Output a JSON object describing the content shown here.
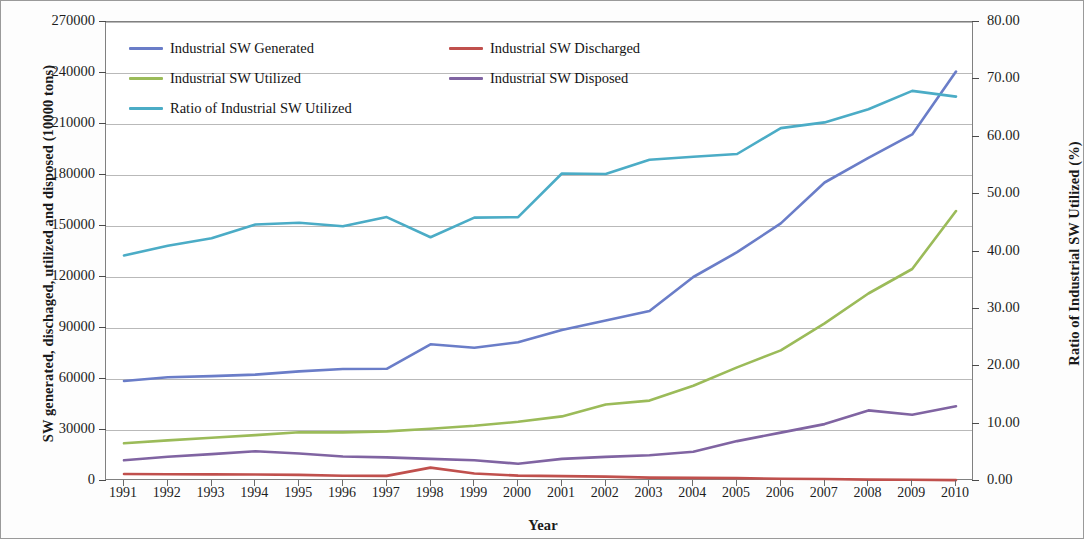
{
  "chart_data": {
    "type": "line",
    "title": "",
    "xlabel": "Year",
    "ylabel": "SW generated, dischaged, utilized and disposed (10000 tons)",
    "y2label": "Ratio of Industrial SW Utilized (%)",
    "categories": [
      "1991",
      "1992",
      "1993",
      "1994",
      "1995",
      "1996",
      "1997",
      "1998",
      "1999",
      "2000",
      "2001",
      "2002",
      "2003",
      "2004",
      "2005",
      "2006",
      "2007",
      "2008",
      "2009",
      "2010"
    ],
    "ylim": [
      0,
      270000
    ],
    "yticks": [
      "0",
      "30000",
      "60000",
      "90000",
      "120000",
      "150000",
      "180000",
      "210000",
      "240000",
      "270000"
    ],
    "ytick_values": [
      0,
      30000,
      60000,
      90000,
      120000,
      150000,
      180000,
      210000,
      240000,
      270000
    ],
    "y2lim": [
      0,
      80
    ],
    "y2ticks": [
      "0.00",
      "10.00",
      "20.00",
      "30.00",
      "40.00",
      "50.00",
      "60.00",
      "70.00",
      "80.00"
    ],
    "y2tick_values": [
      0,
      10,
      20,
      30,
      40,
      50,
      60,
      70,
      80
    ],
    "grid": true,
    "legend_position": "top-left-inside",
    "series": [
      {
        "name": "Industrial SW Generated",
        "color": "#6A7DC8",
        "axis": "left",
        "values": [
          58800,
          61000,
          61700,
          62600,
          64500,
          65900,
          66000,
          80400,
          78400,
          81600,
          88800,
          94500,
          100000,
          120000,
          134600,
          151500,
          175600,
          190100,
          203900,
          240900
        ]
      },
      {
        "name": "Industrial SW Discharged",
        "color": "#C0504D",
        "axis": "left",
        "values": [
          4100,
          4000,
          3900,
          3800,
          3600,
          3100,
          3000,
          7900,
          4400,
          3200,
          2900,
          2600,
          2000,
          1800,
          1700,
          1300,
          1200,
          800,
          700,
          500
        ]
      },
      {
        "name": "Industrial SW  Utilized",
        "color": "#9BBB59",
        "axis": "left",
        "values": [
          22200,
          23900,
          25400,
          27000,
          28700,
          28600,
          29200,
          30700,
          32500,
          34800,
          38000,
          45000,
          47300,
          56000,
          66800,
          76800,
          92700,
          110300,
          124700,
          158800
        ]
      },
      {
        "name": "Industrial SW Disposed",
        "color": "#8064A2",
        "axis": "left",
        "values": [
          12200,
          14300,
          15800,
          17500,
          16200,
          14400,
          13900,
          13000,
          12200,
          10200,
          13000,
          14200,
          15200,
          17200,
          23500,
          28500,
          33500,
          41500,
          39000,
          44000
        ]
      },
      {
        "name": "Ratio of Industrial SW Utilized",
        "color": "#4BACC6",
        "axis": "right",
        "values": [
          39.3,
          41.0,
          42.3,
          44.7,
          45.0,
          44.4,
          46.0,
          42.5,
          45.9,
          46.0,
          53.6,
          53.5,
          56.0,
          56.5,
          57.0,
          61.5,
          62.5,
          64.8,
          68.0,
          67.0
        ]
      }
    ]
  },
  "legend": {
    "items": [
      {
        "label": "Industrial SW Generated",
        "color": "#6A7DC8"
      },
      {
        "label": "Industrial SW Discharged",
        "color": "#C0504D"
      },
      {
        "label": "Industrial SW  Utilized",
        "color": "#9BBB59"
      },
      {
        "label": "Industrial SW Disposed",
        "color": "#8064A2"
      },
      {
        "label": "Ratio of Industrial SW Utilized",
        "color": "#4BACC6"
      }
    ]
  },
  "axes": {
    "x_title": "Year",
    "y_left_title": "SW generated, dischaged, utilized and disposed (10000 tons)",
    "y_right_title": "Ratio of Industrial SW Utilized (%)"
  }
}
